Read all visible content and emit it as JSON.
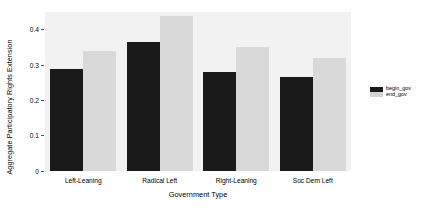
{
  "chart_data": {
    "type": "bar",
    "title": "",
    "xlabel": "Government Type",
    "ylabel": "Aggregate Participatory Rights Extension",
    "categories": [
      "Left-Leaning",
      "Radical Left",
      "Right-Leaning",
      "Soc Dem Left"
    ],
    "series": [
      {
        "name": "begin_gov",
        "color": "#1a1a1a",
        "values": [
          0.29,
          0.365,
          0.28,
          0.265
        ]
      },
      {
        "name": "end_gov",
        "color": "#d9d9d9",
        "values": [
          0.34,
          0.44,
          0.35,
          0.32
        ]
      }
    ],
    "ylim": [
      0,
      0.45
    ],
    "yticks": [
      0,
      0.1,
      0.2,
      0.3,
      0.4
    ],
    "ytick_labels": [
      "0",
      "0.1",
      "0.2",
      "0.3",
      "0.4"
    ],
    "grid": false,
    "legend_position": "right",
    "panel_background": "#f2f2f2",
    "figure_background": "#ffffff"
  },
  "legend": {
    "entries": [
      {
        "label": "begin_gov"
      },
      {
        "label": "end_gov"
      }
    ]
  }
}
